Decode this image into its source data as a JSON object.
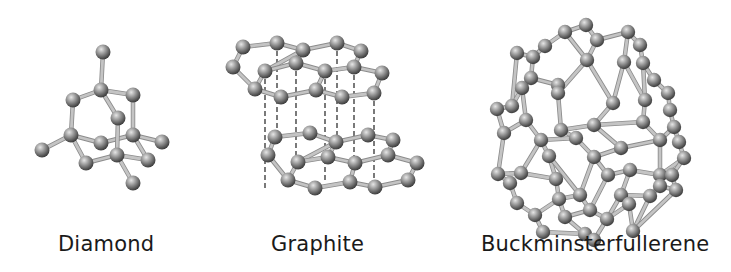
{
  "figure": {
    "structures": [
      {
        "id": "diamond",
        "label": "Diamond",
        "atoms": [
          [
            103,
            52
          ],
          [
            101,
            90
          ],
          [
            73,
            100
          ],
          [
            133,
            95
          ],
          [
            118,
            118
          ],
          [
            71,
            135
          ],
          [
            101,
            143
          ],
          [
            133,
            135
          ],
          [
            162,
            142
          ],
          [
            42,
            150
          ],
          [
            117,
            155
          ],
          [
            86,
            163
          ],
          [
            148,
            160
          ],
          [
            133,
            183
          ]
        ],
        "bonds": [
          [
            0,
            1
          ],
          [
            1,
            2
          ],
          [
            1,
            3
          ],
          [
            1,
            4
          ],
          [
            2,
            5
          ],
          [
            3,
            7
          ],
          [
            5,
            6
          ],
          [
            5,
            9
          ],
          [
            5,
            11
          ],
          [
            6,
            7
          ],
          [
            7,
            8
          ],
          [
            7,
            12
          ],
          [
            4,
            10
          ],
          [
            10,
            11
          ],
          [
            10,
            12
          ],
          [
            10,
            13
          ]
        ],
        "dashed": []
      },
      {
        "id": "graphite",
        "label": "Graphite",
        "atoms": [
          [
            243,
            47
          ],
          [
            277,
            43
          ],
          [
            303,
            50
          ],
          [
            337,
            43
          ],
          [
            361,
            51
          ],
          [
            233,
            67
          ],
          [
            265,
            71
          ],
          [
            296,
            63
          ],
          [
            325,
            71
          ],
          [
            354,
            67
          ],
          [
            382,
            73
          ],
          [
            255,
            89
          ],
          [
            281,
            97
          ],
          [
            316,
            90
          ],
          [
            342,
            97
          ],
          [
            374,
            93
          ],
          [
            275,
            137
          ],
          [
            310,
            133
          ],
          [
            336,
            142
          ],
          [
            368,
            135
          ],
          [
            393,
            140
          ],
          [
            268,
            155
          ],
          [
            298,
            162
          ],
          [
            328,
            157
          ],
          [
            355,
            163
          ],
          [
            388,
            155
          ],
          [
            417,
            163
          ],
          [
            288,
            180
          ],
          [
            315,
            188
          ],
          [
            350,
            182
          ],
          [
            375,
            187
          ],
          [
            408,
            180
          ]
        ],
        "bonds": [
          [
            0,
            1
          ],
          [
            1,
            2
          ],
          [
            2,
            3
          ],
          [
            3,
            4
          ],
          [
            0,
            5
          ],
          [
            5,
            11
          ],
          [
            11,
            6
          ],
          [
            6,
            2
          ],
          [
            6,
            7
          ],
          [
            7,
            8
          ],
          [
            8,
            13
          ],
          [
            13,
            12
          ],
          [
            12,
            11
          ],
          [
            4,
            9
          ],
          [
            9,
            8
          ],
          [
            9,
            10
          ],
          [
            10,
            15
          ],
          [
            15,
            14
          ],
          [
            14,
            13
          ],
          [
            2,
            7
          ],
          [
            16,
            17
          ],
          [
            17,
            18
          ],
          [
            18,
            19
          ],
          [
            19,
            20
          ],
          [
            16,
            21
          ],
          [
            21,
            27
          ],
          [
            27,
            22
          ],
          [
            22,
            18
          ],
          [
            22,
            23
          ],
          [
            23,
            24
          ],
          [
            24,
            29
          ],
          [
            29,
            28
          ],
          [
            28,
            27
          ],
          [
            20,
            25
          ],
          [
            25,
            24
          ],
          [
            25,
            26
          ],
          [
            26,
            31
          ],
          [
            31,
            30
          ],
          [
            30,
            29
          ],
          [
            18,
            23
          ]
        ],
        "dashed": [
          [
            277,
            43,
            277,
            137
          ],
          [
            296,
            63,
            296,
            162
          ],
          [
            337,
            43,
            337,
            142
          ],
          [
            354,
            67,
            354,
            163
          ],
          [
            265,
            71,
            265,
            188
          ],
          [
            325,
            71,
            325,
            182
          ],
          [
            374,
            93,
            374,
            187
          ]
        ]
      },
      {
        "id": "buckminsterfullerene",
        "label": "Buckminsterfullerene",
        "atoms": [
          [
            586,
            25
          ],
          [
            565,
            32
          ],
          [
            597,
            40
          ],
          [
            628,
            32
          ],
          [
            640,
            45
          ],
          [
            545,
            46
          ],
          [
            533,
            57
          ],
          [
            517,
            53
          ],
          [
            587,
            60
          ],
          [
            624,
            62
          ],
          [
            643,
            63
          ],
          [
            654,
            80
          ],
          [
            668,
            93
          ],
          [
            670,
            110
          ],
          [
            531,
            78
          ],
          [
            558,
            85
          ],
          [
            558,
            93
          ],
          [
            512,
            106
          ],
          [
            497,
            109
          ],
          [
            522,
            88
          ],
          [
            613,
            103
          ],
          [
            645,
            100
          ],
          [
            643,
            122
          ],
          [
            674,
            127
          ],
          [
            679,
            142
          ],
          [
            504,
            133
          ],
          [
            526,
            120
          ],
          [
            561,
            130
          ],
          [
            594,
            125
          ],
          [
            576,
            138
          ],
          [
            621,
            148
          ],
          [
            660,
            140
          ],
          [
            684,
            158
          ],
          [
            660,
            175
          ],
          [
            549,
            156
          ],
          [
            541,
            140
          ],
          [
            594,
            157
          ],
          [
            608,
            175
          ],
          [
            630,
            170
          ],
          [
            672,
            175
          ],
          [
            498,
            174
          ],
          [
            521,
            173
          ],
          [
            556,
            179
          ],
          [
            559,
            199
          ],
          [
            580,
            195
          ],
          [
            510,
            183
          ],
          [
            517,
            203
          ],
          [
            535,
            215
          ],
          [
            565,
            217
          ],
          [
            590,
            210
          ],
          [
            621,
            195
          ],
          [
            650,
            196
          ],
          [
            660,
            186
          ],
          [
            676,
            190
          ],
          [
            633,
            231
          ],
          [
            585,
            234
          ],
          [
            607,
            219
          ],
          [
            543,
            232
          ],
          [
            594,
            240
          ],
          [
            629,
            204
          ]
        ],
        "bonds": [
          [
            0,
            1
          ],
          [
            0,
            2
          ],
          [
            2,
            3
          ],
          [
            3,
            4
          ],
          [
            1,
            5
          ],
          [
            5,
            6
          ],
          [
            6,
            7
          ],
          [
            1,
            8
          ],
          [
            2,
            8
          ],
          [
            3,
            9
          ],
          [
            4,
            10
          ],
          [
            10,
            11
          ],
          [
            11,
            12
          ],
          [
            12,
            13
          ],
          [
            6,
            14
          ],
          [
            7,
            17
          ],
          [
            17,
            18
          ],
          [
            14,
            15
          ],
          [
            15,
            16
          ],
          [
            14,
            19
          ],
          [
            19,
            17
          ],
          [
            8,
            16
          ],
          [
            8,
            20
          ],
          [
            9,
            20
          ],
          [
            9,
            21
          ],
          [
            21,
            22
          ],
          [
            10,
            21
          ],
          [
            13,
            23
          ],
          [
            23,
            24
          ],
          [
            18,
            25
          ],
          [
            25,
            26
          ],
          [
            26,
            19
          ],
          [
            16,
            27
          ],
          [
            27,
            28
          ],
          [
            28,
            20
          ],
          [
            22,
            28
          ],
          [
            27,
            29
          ],
          [
            29,
            35
          ],
          [
            35,
            26
          ],
          [
            22,
            31
          ],
          [
            31,
            23
          ],
          [
            30,
            31
          ],
          [
            28,
            30
          ],
          [
            24,
            32
          ],
          [
            32,
            33
          ],
          [
            33,
            31
          ],
          [
            29,
            36
          ],
          [
            36,
            30
          ],
          [
            36,
            37
          ],
          [
            37,
            38
          ],
          [
            38,
            33
          ],
          [
            25,
            40
          ],
          [
            40,
            41
          ],
          [
            41,
            35
          ],
          [
            35,
            34
          ],
          [
            34,
            42
          ],
          [
            42,
            41
          ],
          [
            34,
            44
          ],
          [
            44,
            36
          ],
          [
            42,
            43
          ],
          [
            43,
            44
          ],
          [
            40,
            45
          ],
          [
            45,
            46
          ],
          [
            46,
            47
          ],
          [
            47,
            43
          ],
          [
            43,
            48
          ],
          [
            48,
            49
          ],
          [
            49,
            44
          ],
          [
            49,
            37
          ],
          [
            38,
            50
          ],
          [
            50,
            51
          ],
          [
            51,
            52
          ],
          [
            52,
            53
          ],
          [
            39,
            53
          ],
          [
            39,
            32
          ],
          [
            33,
            39
          ],
          [
            51,
            54
          ],
          [
            53,
            54
          ],
          [
            48,
            55
          ],
          [
            47,
            57
          ],
          [
            57,
            55
          ],
          [
            55,
            58
          ],
          [
            58,
            56
          ],
          [
            56,
            50
          ],
          [
            56,
            59
          ],
          [
            59,
            54
          ],
          [
            49,
            56
          ]
        ],
        "dashed": []
      }
    ],
    "labels": {
      "diamond": "Diamond",
      "graphite": "Graphite",
      "fullerene": "Buckminsterfullerene"
    },
    "colors": {
      "atom_light": "#d2d2d2",
      "atom_mid": "#8a8a8a",
      "atom_dark": "#3c3c3c",
      "bond": "#a9a9a9",
      "bond_edge": "#8c8c8c",
      "dash": "#222222",
      "label": "#1a1a1a",
      "background": "#ffffff"
    }
  }
}
